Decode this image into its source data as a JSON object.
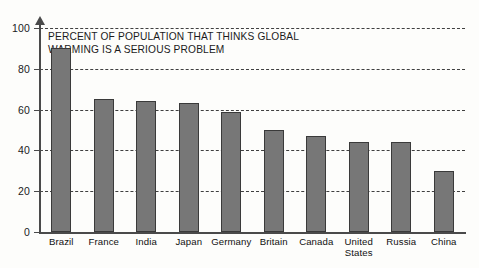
{
  "chart_data": {
    "type": "bar",
    "title": "PERCENT OF POPULATION THAT THINKS GLOBAL WARMING IS A SERIOUS PROBLEM",
    "title_lines": [
      "PERCENT OF POPULATION THAT THINKS GLOBAL",
      "WARMING IS A SERIOUS PROBLEM"
    ],
    "categories": [
      "Brazil",
      "France",
      "India",
      "Japan",
      "Germany",
      "Britain",
      "Canada",
      "United States",
      "Russia",
      "China"
    ],
    "values": [
      90,
      65,
      64,
      63,
      59,
      50,
      47,
      44,
      44,
      30
    ],
    "xlabel": "",
    "ylabel": "",
    "ylim": [
      0,
      100
    ],
    "yticks": [
      0,
      20,
      40,
      60,
      80,
      100
    ],
    "ytick_labels": [
      "0",
      "20",
      "40",
      "60",
      "80",
      "100"
    ],
    "grid": "horizontal-dashed",
    "legend": "none",
    "bar_color": "#777777",
    "bar_border_color": "#3a3a3a",
    "axis_color": "#4a4a4a",
    "background_color": "#fdfdfb"
  }
}
